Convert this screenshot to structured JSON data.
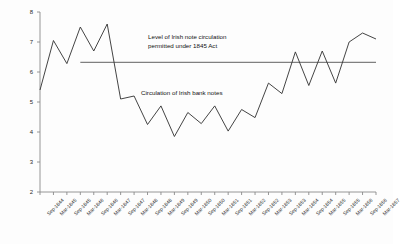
{
  "chart_data": {
    "type": "line",
    "title": "",
    "xlabel": "",
    "ylabel": "",
    "ylim": [
      2,
      8
    ],
    "yticks": [
      2,
      3,
      4,
      5,
      6,
      7,
      8
    ],
    "grid": false,
    "legend": "none (inline annotations)",
    "categories": [
      "Sep-1844",
      "Mar-1845",
      "Sep-1845",
      "Mar-1846",
      "Sep-1846",
      "Mar-1847",
      "Sep-1847",
      "Mar-1848",
      "Sep-1848",
      "Mar-1849",
      "Sep-1849",
      "Mar-1850",
      "Sep-1850",
      "Mar-1851",
      "Sep-1851",
      "Mar-1852",
      "Sep-1852",
      "Mar-1853",
      "Sep-1853",
      "Mar-1854",
      "Sep-1854",
      "Mar-1855",
      "Sep-1855",
      "Mar-1856",
      "Sep-1856",
      "Mar-1857"
    ],
    "series": [
      {
        "name": "Circulation of Irish bank notes",
        "color": "#3a3a3a",
        "values": [
          5.4,
          7.05,
          6.28,
          7.5,
          6.7,
          7.6,
          5.1,
          5.2,
          4.25,
          4.87,
          3.85,
          4.65,
          4.28,
          4.87,
          4.03,
          4.75,
          4.48,
          5.63,
          5.28,
          6.67,
          5.55,
          6.7,
          5.63,
          7.0,
          7.3,
          7.1
        ]
      },
      {
        "name": "Level of Irish note circulation permitted under 1845 Act",
        "color": "#808080",
        "constant_value": 6.32,
        "starts_at_category": "Mar-1846",
        "values": [
          null,
          null,
          null,
          6.32,
          6.32,
          6.32,
          6.32,
          6.32,
          6.32,
          6.32,
          6.32,
          6.32,
          6.32,
          6.32,
          6.32,
          6.32,
          6.32,
          6.32,
          6.32,
          6.32,
          6.32,
          6.32,
          6.32,
          6.32,
          6.32,
          6.32
        ]
      }
    ],
    "annotations": [
      {
        "id": "limit-label",
        "line1": "Level of Irish note circulation",
        "line2": "permitted under 1845 Act"
      },
      {
        "id": "series-label",
        "text": "Circulation of Irish bank notes"
      }
    ]
  },
  "axis": {
    "y_tick_labels": [
      "8",
      "7",
      "6",
      "5",
      "4",
      "3",
      "2"
    ],
    "x_tick_labels": [
      "Sep-1844",
      "Mar-1845",
      "Sep-1845",
      "Mar-1846",
      "Sep-1846",
      "Mar-1847",
      "Sep-1847",
      "Mar-1848",
      "Sep-1848",
      "Mar-1849",
      "Sep-1849",
      "Mar-1850",
      "Sep-1850",
      "Mar-1851",
      "Sep-1851",
      "Mar-1852",
      "Sep-1852",
      "Mar-1853",
      "Sep-1853",
      "Mar-1854",
      "Sep-1854",
      "Mar-1855",
      "Sep-1855",
      "Mar-1856",
      "Sep-1856",
      "Mar-1857"
    ]
  },
  "annotations": {
    "limit_line1": "Level of Irish note circulation",
    "limit_line2": "permitted under 1845 Act",
    "series_label": "Circulation of Irish bank notes"
  },
  "colors": {
    "series_line": "#3a3a3a",
    "limit_line": "#808080",
    "axis": "#808080",
    "text": "#222222",
    "background": "#fdfdfd"
  }
}
